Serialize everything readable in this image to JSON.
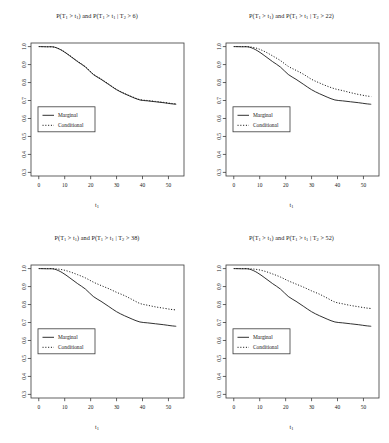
{
  "figure": {
    "background": "#ffffff",
    "axis_color": "#3a3a3a",
    "curve_color": "#1a1a1a",
    "layout": "2x2 grid of panels",
    "xlabel": "t",
    "xlabel_sub": "1"
  },
  "axes": {
    "xlim": [
      -3,
      56
    ],
    "ylim": [
      0.28,
      1.02
    ],
    "xticks": [
      0,
      10,
      20,
      30,
      40,
      50
    ],
    "xtick_labels": [
      "0",
      "10",
      "20",
      "30",
      "40",
      "50"
    ],
    "yticks": [
      0.3,
      0.4,
      0.5,
      0.6,
      0.7,
      0.8,
      0.9,
      1.0
    ],
    "ytick_labels": [
      "0.3",
      "0.4",
      "0.5",
      "0.6",
      "0.7",
      "0.8",
      "0.9",
      "1.0"
    ],
    "grid": false,
    "ytick_label_rotation": -90
  },
  "legend": {
    "position": "left-middle",
    "entries": [
      {
        "label": "Marginal",
        "style": "solid"
      },
      {
        "label": "Conditional",
        "style": "dotted"
      }
    ]
  },
  "chart_data": [
    {
      "type": "line",
      "panel": 1,
      "title": "P(T1 > t1) and P(T1 > t1 | T2 > 6)",
      "title_parts": {
        "p1": "P(T",
        "s1": "1",
        "p2": " > t",
        "s2": "1",
        "p3": ") and P(T",
        "s3": "1",
        "p4": " > t",
        "s4": "1",
        "p5": " | T",
        "s5": "2",
        "p6": " > 6)"
      },
      "condition_threshold": 6,
      "xlabel": "t1",
      "ylabel": "",
      "xlim": [
        -3,
        56
      ],
      "ylim": [
        0.28,
        1.02
      ],
      "x": [
        0,
        3,
        6,
        9,
        12,
        15,
        18,
        21,
        24,
        27,
        30,
        33,
        36,
        39,
        42,
        45,
        48,
        51,
        53
      ],
      "series": [
        {
          "name": "Marginal",
          "style": "solid",
          "values": [
            1.0,
            0.999,
            0.997,
            0.978,
            0.948,
            0.916,
            0.886,
            0.845,
            0.818,
            0.789,
            0.76,
            0.738,
            0.719,
            0.703,
            0.698,
            0.693,
            0.688,
            0.682,
            0.679
          ]
        },
        {
          "name": "Conditional",
          "style": "dotted",
          "values": [
            1.0,
            0.999,
            0.997,
            0.979,
            0.95,
            0.918,
            0.888,
            0.847,
            0.82,
            0.791,
            0.762,
            0.74,
            0.721,
            0.705,
            0.7,
            0.695,
            0.69,
            0.684,
            0.681
          ]
        }
      ]
    },
    {
      "type": "line",
      "panel": 2,
      "title": "P(T1 > t1) and P(T1 > t1 | T2 > 22)",
      "title_parts": {
        "p1": "P(T",
        "s1": "1",
        "p2": " > t",
        "s2": "1",
        "p3": ") and P(T",
        "s3": "1",
        "p4": " > t",
        "s4": "1",
        "p5": " | T",
        "s5": "2",
        "p6": " > 22)"
      },
      "condition_threshold": 22,
      "xlabel": "t1",
      "ylabel": "",
      "xlim": [
        -3,
        56
      ],
      "ylim": [
        0.28,
        1.02
      ],
      "x": [
        0,
        3,
        6,
        9,
        12,
        15,
        18,
        21,
        24,
        27,
        30,
        33,
        36,
        39,
        42,
        45,
        48,
        51,
        53
      ],
      "series": [
        {
          "name": "Marginal",
          "style": "solid",
          "values": [
            1.0,
            0.999,
            0.997,
            0.978,
            0.948,
            0.916,
            0.886,
            0.845,
            0.818,
            0.789,
            0.76,
            0.738,
            0.719,
            0.703,
            0.698,
            0.693,
            0.688,
            0.682,
            0.679
          ]
        },
        {
          "name": "Conditional",
          "style": "dotted",
          "values": [
            1.0,
            1.0,
            0.999,
            0.99,
            0.972,
            0.948,
            0.922,
            0.89,
            0.868,
            0.845,
            0.818,
            0.798,
            0.78,
            0.765,
            0.755,
            0.744,
            0.734,
            0.726,
            0.722
          ]
        }
      ]
    },
    {
      "type": "line",
      "panel": 3,
      "title": "P(T1 > t1) and P(T1 > t1 | T2 > 38)",
      "title_parts": {
        "p1": "P(T",
        "s1": "1",
        "p2": " > t",
        "s2": "1",
        "p3": ") and P(T",
        "s3": "1",
        "p4": " > t",
        "s4": "1",
        "p5": " | T",
        "s5": "2",
        "p6": " > 38)"
      },
      "condition_threshold": 38,
      "xlabel": "t1",
      "ylabel": "",
      "xlim": [
        -3,
        56
      ],
      "ylim": [
        0.28,
        1.02
      ],
      "x": [
        0,
        3,
        6,
        9,
        12,
        15,
        18,
        21,
        24,
        27,
        30,
        33,
        36,
        39,
        42,
        45,
        48,
        51,
        53
      ],
      "series": [
        {
          "name": "Marginal",
          "style": "solid",
          "values": [
            1.0,
            0.999,
            0.997,
            0.978,
            0.948,
            0.916,
            0.886,
            0.845,
            0.818,
            0.789,
            0.76,
            0.738,
            0.719,
            0.703,
            0.698,
            0.693,
            0.688,
            0.682,
            0.679
          ]
        },
        {
          "name": "Conditional",
          "style": "dotted",
          "values": [
            1.0,
            1.0,
            0.999,
            0.994,
            0.982,
            0.966,
            0.948,
            0.925,
            0.906,
            0.888,
            0.868,
            0.85,
            0.828,
            0.806,
            0.796,
            0.787,
            0.78,
            0.773,
            0.77
          ]
        }
      ]
    },
    {
      "type": "line",
      "panel": 4,
      "title": "P(T1 > t1) and P(T1 > t1 | T2 > 52)",
      "title_parts": {
        "p1": "P(T",
        "s1": "1",
        "p2": " > t",
        "s2": "1",
        "p3": ") and P(T",
        "s3": "1",
        "p4": " > t",
        "s4": "1",
        "p5": " | T",
        "s5": "2",
        "p6": " > 52)"
      },
      "condition_threshold": 52,
      "xlabel": "t1",
      "ylabel": "",
      "xlim": [
        -3,
        56
      ],
      "ylim": [
        0.28,
        1.02
      ],
      "x": [
        0,
        3,
        6,
        9,
        12,
        15,
        18,
        21,
        24,
        27,
        30,
        33,
        36,
        39,
        42,
        45,
        48,
        51,
        53
      ],
      "series": [
        {
          "name": "Marginal",
          "style": "solid",
          "values": [
            1.0,
            0.999,
            0.997,
            0.978,
            0.948,
            0.916,
            0.886,
            0.845,
            0.818,
            0.789,
            0.76,
            0.738,
            0.719,
            0.703,
            0.698,
            0.693,
            0.688,
            0.682,
            0.679
          ]
        },
        {
          "name": "Conditional",
          "style": "dotted",
          "values": [
            1.0,
            1.0,
            0.999,
            0.995,
            0.985,
            0.97,
            0.953,
            0.932,
            0.914,
            0.896,
            0.876,
            0.858,
            0.836,
            0.814,
            0.804,
            0.795,
            0.788,
            0.781,
            0.778
          ]
        }
      ]
    }
  ]
}
